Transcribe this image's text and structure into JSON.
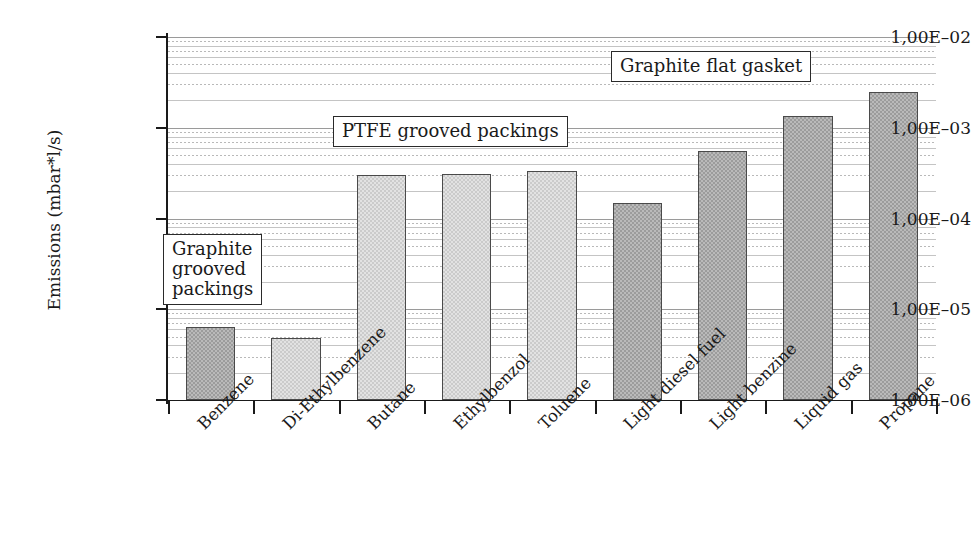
{
  "chart_data": {
    "type": "bar",
    "title": "",
    "xlabel": "",
    "ylabel": "Emissions (mbar*l/s)",
    "yscale": "log",
    "ylim": [
      1e-06,
      0.01
    ],
    "grid": true,
    "legend_position": "none",
    "ytick_labels": [
      "1,00E–02",
      "1,00E–03",
      "1,00E–04",
      "1,00E–05",
      "1,00E–06"
    ],
    "ytick_values": [
      0.01,
      0.001,
      0.0001,
      1e-05,
      1e-06
    ],
    "categories": [
      "Benzene",
      "Di-Ethylbenzene",
      "Butane",
      "Ethylbenzol",
      "Toluene",
      "Light diesel fuel",
      "Light benzine",
      "Liquid gas",
      "Propane"
    ],
    "values": [
      6.3e-06,
      4.8e-06,
      0.0003,
      0.00031,
      0.00033,
      0.00015,
      0.00055,
      0.00135,
      0.0025
    ],
    "bar_shades": [
      "dark",
      "light",
      "light",
      "light",
      "light",
      "dark",
      "dark",
      "dark",
      "dark"
    ],
    "annotations": [
      {
        "id": "graphite-grooved",
        "text": "Graphite grooved packings",
        "lines": [
          "Graphite",
          "grooved",
          "packings"
        ]
      },
      {
        "id": "ptfe-grooved",
        "text": "PTFE grooved packings",
        "lines": [
          "PTFE grooved packings"
        ]
      },
      {
        "id": "graphite-flat",
        "text": "Graphite flat gasket",
        "lines": [
          "Graphite flat gasket"
        ]
      }
    ],
    "colors": {
      "bar_dark": "#9c9c9c",
      "bar_light": "#cbcbcb",
      "bar_border": "#4a4a4a",
      "axis": "#1a1a1a",
      "grid_major": "#9a9a9a",
      "grid_minor": "#b9b9b9",
      "background": "#ffffff"
    }
  }
}
